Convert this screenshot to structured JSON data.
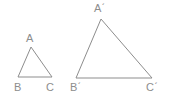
{
  "figure": {
    "kind": "geometry-figure",
    "background_color": "#ffffff",
    "stroke_color": "#8d8d8d",
    "label_color": "#8d8d8d",
    "stroke_width": 1,
    "shapes": [
      {
        "name": "triangle-abc",
        "points": "31,47 18,77 52,77",
        "vertices": [
          {
            "label": "A",
            "x": 31,
            "y": 47
          },
          {
            "label": "B",
            "x": 18,
            "y": 77
          },
          {
            "label": "C",
            "x": 52,
            "y": 77
          }
        ]
      },
      {
        "name": "triangle-abc-prime",
        "points": "101,19 76,78 152,78",
        "vertices": [
          {
            "label": "Aˊ",
            "x": 101,
            "y": 19
          },
          {
            "label": "Bˊ",
            "x": 76,
            "y": 78
          },
          {
            "label": "Cˊ",
            "x": 152,
            "y": 78
          }
        ]
      }
    ],
    "labels": {
      "a": "A",
      "b": "B",
      "c": "C",
      "a_prime": "Aˊ",
      "b_prime": "Bˊ",
      "c_prime": "Cˊ"
    }
  }
}
